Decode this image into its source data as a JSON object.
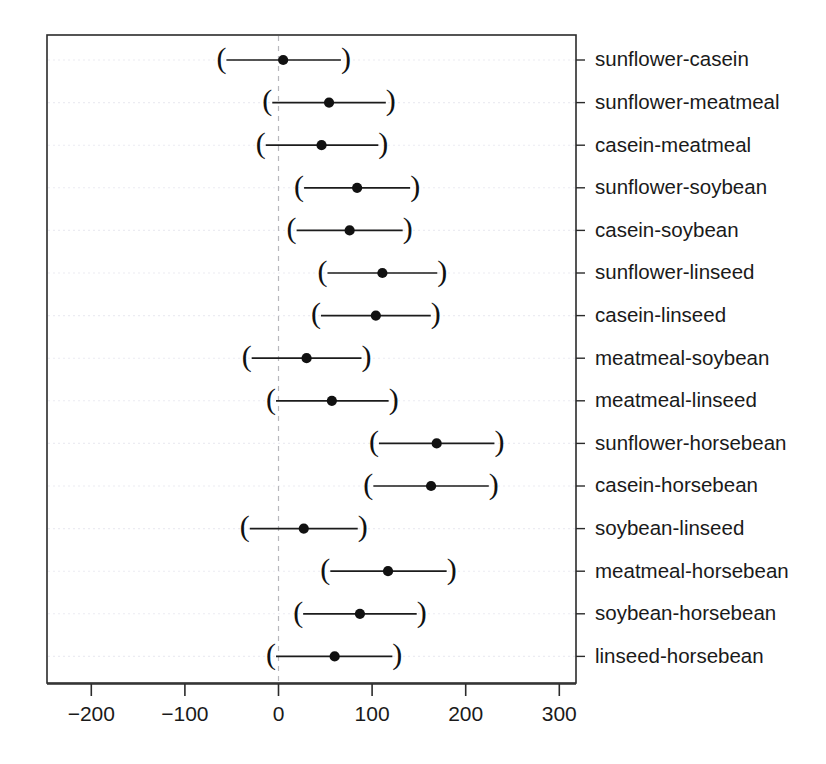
{
  "chart_data": {
    "type": "scatter",
    "subtype": "confidence-interval-dotplot",
    "title": "",
    "subtitle": "",
    "xlabel": "",
    "ylabel": "",
    "xlim": [
      -245,
      335
    ],
    "xticks": [
      -200,
      -100,
      0,
      100,
      200,
      300
    ],
    "xtick_labels": [
      "-200",
      "-100",
      "0",
      "100",
      "200",
      "300"
    ],
    "grid": true,
    "grid_axis": "y",
    "legend": "none",
    "reference_line": 0,
    "reference_line_style": "dashed",
    "interval_marker": "parentheses",
    "point_marker": "filled-circle",
    "categories": [
      "sunflower-casein",
      "sunflower-meatmeal",
      "casein-meatmeal",
      "sunflower-soybean",
      "casein-soybean",
      "sunflower-linseed",
      "casein-linseed",
      "meatmeal-soybean",
      "meatmeal-linseed",
      "sunflower-horsebean",
      "casein-horsebean",
      "soybean-linseed",
      "meatmeal-horsebean",
      "soybean-horsebean",
      "linseed-horsebean"
    ],
    "estimates": [
      5,
      54,
      46,
      84,
      76,
      111,
      104,
      30,
      57,
      169,
      163,
      27,
      117,
      87,
      60
    ],
    "lower": [
      -61,
      -12,
      -19,
      22,
      14,
      47,
      40,
      -34,
      -8,
      102,
      96,
      -36,
      50,
      21,
      -8
    ],
    "upper": [
      72,
      120,
      112,
      146,
      138,
      175,
      168,
      94,
      123,
      236,
      230,
      90,
      185,
      153,
      127
    ],
    "series": [
      {
        "name": "sunflower-casein",
        "estimate": 5,
        "lower": -61,
        "upper": 72
      },
      {
        "name": "sunflower-meatmeal",
        "estimate": 54,
        "lower": -12,
        "upper": 120
      },
      {
        "name": "casein-meatmeal",
        "estimate": 46,
        "lower": -19,
        "upper": 112
      },
      {
        "name": "sunflower-soybean",
        "estimate": 84,
        "lower": 22,
        "upper": 146
      },
      {
        "name": "casein-soybean",
        "estimate": 76,
        "lower": 14,
        "upper": 138
      },
      {
        "name": "sunflower-linseed",
        "estimate": 111,
        "lower": 47,
        "upper": 175
      },
      {
        "name": "casein-linseed",
        "estimate": 104,
        "lower": 40,
        "upper": 168
      },
      {
        "name": "meatmeal-soybean",
        "estimate": 30,
        "lower": -34,
        "upper": 94
      },
      {
        "name": "meatmeal-linseed",
        "estimate": 57,
        "lower": -8,
        "upper": 123
      },
      {
        "name": "sunflower-horsebean",
        "estimate": 169,
        "lower": 102,
        "upper": 236
      },
      {
        "name": "casein-horsebean",
        "estimate": 163,
        "lower": 96,
        "upper": 230
      },
      {
        "name": "soybean-linseed",
        "estimate": 27,
        "lower": -36,
        "upper": 90
      },
      {
        "name": "meatmeal-horsebean",
        "estimate": 117,
        "lower": 50,
        "upper": 185
      },
      {
        "name": "soybean-horsebean",
        "estimate": 87,
        "lower": 21,
        "upper": 153
      },
      {
        "name": "linseed-horsebean",
        "estimate": 60,
        "lower": -8,
        "upper": 127
      }
    ],
    "colors": {
      "foreground": "#111111",
      "frame": "#2b2b2b",
      "grid": "#ececf2",
      "reference": "#b8b8bd",
      "background": "#ffffff"
    }
  },
  "axis": {
    "left_paren": "(",
    "right_paren": ")"
  }
}
